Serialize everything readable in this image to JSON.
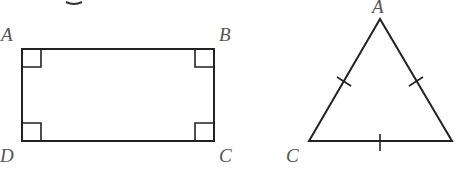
{
  "diagram": {
    "rectangle": {
      "vertices": {
        "A": "A",
        "B": "B",
        "C": "C",
        "D": "D"
      },
      "right_angle_markers": 4
    },
    "triangle": {
      "vertices": {
        "A": "A",
        "C": "C"
      },
      "tick_marks": 3,
      "description": "equilateral triangle with equal-side tick marks"
    },
    "colors": {
      "stroke": "#222222",
      "label": "#555555"
    }
  }
}
